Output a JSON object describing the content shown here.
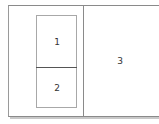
{
  "diagram": {
    "type": "pane-layout",
    "panes": [
      {
        "id": "pane-1",
        "label": "1"
      },
      {
        "id": "pane-2",
        "label": "2"
      },
      {
        "id": "pane-3",
        "label": "3"
      }
    ],
    "colors": {
      "border": "#8a8a8a",
      "inner_border": "#a8a8a8",
      "split_line": "#555555",
      "shadow": "#c8c8c8",
      "text": "#333333",
      "background": "#ffffff"
    }
  }
}
